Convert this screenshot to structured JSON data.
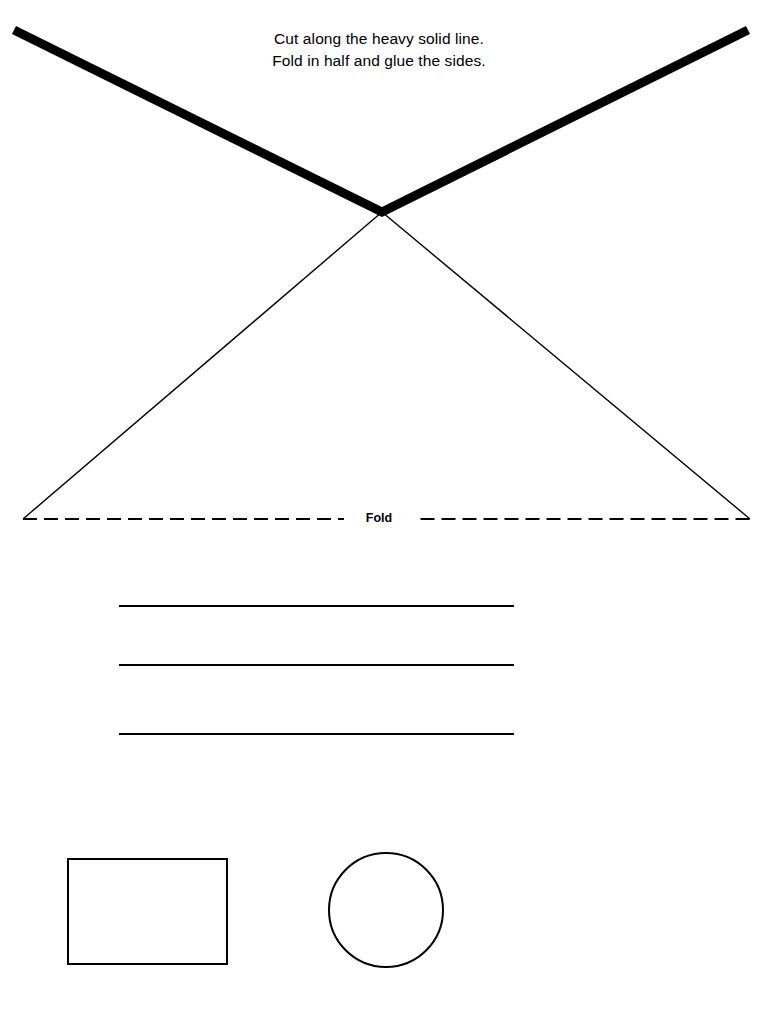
{
  "page": {
    "background_color": "#ffffff",
    "ink_color": "#000000",
    "width": 758,
    "height": 1012
  },
  "instructions": {
    "line1": "Cut along the heavy solid line.",
    "line2": "Fold in half and glue the sides."
  },
  "fold_line": {
    "label": "Fold",
    "style": "dashed",
    "dash": "14 7",
    "y": 519,
    "x_start": 23,
    "x_end": 750
  },
  "cut_line": {
    "name": "heavy-solid-cut-line",
    "style": "solid",
    "stroke_width": 9,
    "points": [
      {
        "x": 14,
        "y": 30
      },
      {
        "x": 382,
        "y": 212
      },
      {
        "x": 748,
        "y": 30
      }
    ]
  },
  "fold_triangle": {
    "name": "thin-fold-triangle",
    "style": "solid",
    "stroke_width": 1.4,
    "points": [
      {
        "x": 382,
        "y": 212
      },
      {
        "x": 23,
        "y": 519
      },
      {
        "x": 750,
        "y": 519
      }
    ]
  },
  "writing_lines": {
    "count": 3,
    "x_start": 119,
    "x_end": 514,
    "stroke_width": 1.8,
    "rows": [
      {
        "y": 606
      },
      {
        "y": 665
      },
      {
        "y": 734
      }
    ]
  },
  "shapes": {
    "rectangle": {
      "name": "rectangle-shape",
      "x": 68,
      "y": 859,
      "width": 159,
      "height": 105,
      "stroke_width": 2
    },
    "circle": {
      "name": "circle-shape",
      "cx": 386,
      "cy": 910,
      "r": 57,
      "stroke_width": 2
    }
  }
}
